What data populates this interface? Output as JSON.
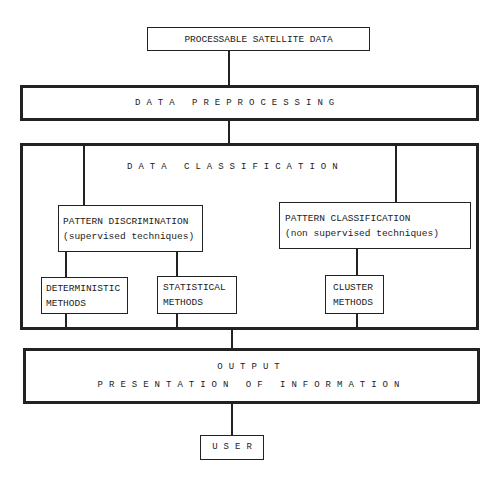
{
  "diagram": {
    "source": {
      "label": "PROCESSABLE SATELLITE DATA"
    },
    "preprocessing": {
      "label": "DATA PREPROCESSING"
    },
    "classification": {
      "label": "DATA CLASSIFICATION",
      "pattern_discrimination": {
        "title": "PATTERN DISCRIMINATION",
        "subtitle": "(supervised techniques)"
      },
      "pattern_classification": {
        "title": "PATTERN CLASSIFICATION",
        "subtitle": "(non supervised techniques)"
      },
      "methods": [
        {
          "line1": "DETERMINISTIC",
          "line2": "METHODS"
        },
        {
          "line1": "STATISTICAL",
          "line2": "METHODS"
        },
        {
          "line1": "CLUSTER",
          "line2": "METHODS"
        }
      ]
    },
    "output": {
      "line1": "OUTPUT",
      "line2": "PRESENTATION OF INFORMATION"
    },
    "user": {
      "label": "USER"
    }
  }
}
